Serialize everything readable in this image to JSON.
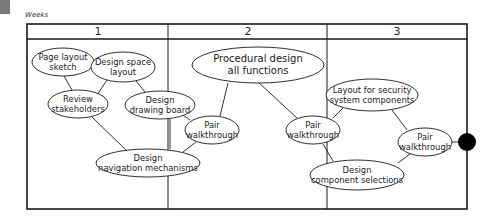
{
  "header": {
    "axis_label": "Weeks"
  },
  "weeks": [
    {
      "label": "1",
      "x": 98
    },
    {
      "label": "2",
      "x": 248
    },
    {
      "label": "3",
      "x": 397
    }
  ],
  "nodes": {
    "page_layout_sketch": {
      "lines": [
        "Page layout",
        "sketch"
      ]
    },
    "design_space_layout": {
      "lines": [
        "Design space",
        "layout"
      ]
    },
    "review_stakeholders": {
      "lines": [
        "Review",
        "stakeholders"
      ]
    },
    "design_drawing_board": {
      "lines": [
        "Design",
        "drawing board"
      ]
    },
    "pair_walkthrough_1": {
      "lines": [
        "Pair",
        "walkthrough"
      ]
    },
    "design_navigation_mechanisms": {
      "lines": [
        "Design",
        "navigation mechanisms"
      ]
    },
    "procedural_design_all_functions": {
      "lines": [
        "Procedural design",
        "all functions"
      ]
    },
    "pair_walkthrough_2": {
      "lines": [
        "Pair",
        "walkthrough"
      ]
    },
    "layout_security_components": {
      "lines": [
        "Layout for security",
        "system components"
      ]
    },
    "pair_walkthrough_3": {
      "lines": [
        "Pair",
        "walkthrough"
      ]
    },
    "design_component_selections": {
      "lines": [
        "Design",
        "component selections"
      ]
    }
  },
  "colors": {
    "line": "#1a1a1a",
    "milestone": "#000000",
    "gray_box": "#7a7a7a"
  }
}
